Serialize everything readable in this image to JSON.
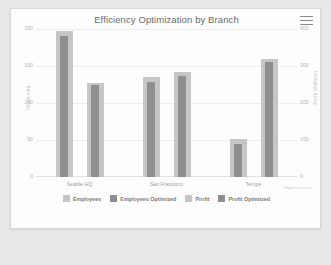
{
  "card": {
    "title": "Efficiency Optimization by Branch",
    "menu_icon": "hamburger-menu-icon",
    "credit": "Highcharts.com"
  },
  "chart_data": {
    "type": "bar",
    "title": "Efficiency Optimization by Branch",
    "xlabel": "",
    "ylabel": "Headcount",
    "y2label": "Profit (millions)",
    "categories": [
      "Seattle HQ",
      "San Francisco",
      "Tempe"
    ],
    "ylim": [
      0,
      200
    ],
    "y2lim": [
      0,
      400
    ],
    "yticks": [
      "0",
      "50",
      "100",
      "150",
      "200"
    ],
    "y2ticks": [
      "0",
      "100",
      "200",
      "300",
      "400"
    ],
    "grid": true,
    "legend_position": "bottom",
    "series": [
      {
        "name": "Employees",
        "axis": "left",
        "color": "#c6c6c6",
        "values": [
          197,
          135,
          52
        ]
      },
      {
        "name": "Employees Optimized",
        "axis": "left",
        "color": "#8f8f8f",
        "values": [
          190,
          128,
          45
        ]
      },
      {
        "name": "Profit",
        "axis": "right",
        "color": "#c6c6c6",
        "values": [
          255,
          285,
          320
        ]
      },
      {
        "name": "Profit Optimized",
        "axis": "right",
        "color": "#8f8f8f",
        "values": [
          248,
          272,
          312
        ]
      }
    ]
  },
  "legend": [
    {
      "label": "Employees",
      "color": "#c6c6c6"
    },
    {
      "label": "Employees Optimized",
      "color": "#8f8f8f"
    },
    {
      "label": "Profit",
      "color": "#c6c6c6"
    },
    {
      "label": "Profit Optimized",
      "color": "#8f8f8f"
    }
  ]
}
